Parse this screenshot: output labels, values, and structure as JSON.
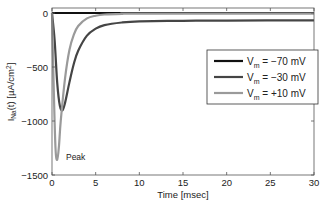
{
  "chart_data": {
    "type": "line",
    "title": "",
    "xlabel": "Time [msec]",
    "ylabel": "I_Na(t) [µA/cm²]",
    "ylabel_parts": {
      "main": "I",
      "sub": "Na",
      "rest": "(t) [µA/cm",
      "sup": "2",
      "end": "]"
    },
    "xlim": [
      0,
      30
    ],
    "ylim": [
      -1500,
      50
    ],
    "xticks": [
      0,
      5,
      10,
      15,
      20,
      25,
      30
    ],
    "yticks": [
      0,
      -500,
      -1000,
      -1500
    ],
    "xtick_labels": [
      "0",
      "5",
      "10",
      "15",
      "20",
      "25",
      "30"
    ],
    "ytick_labels": [
      "0",
      "−500",
      "−1000",
      "−1500"
    ],
    "grid": false,
    "legend_position": "right-center",
    "annotations": [
      {
        "text": "Peak",
        "x": 1.6,
        "y": -1330
      }
    ],
    "series": [
      {
        "name": "Vm = −70 mV",
        "legend": {
          "main": "V",
          "sub": "m",
          "rest": " = −70 mV"
        },
        "color": "#111111",
        "x": [
          0,
          30
        ],
        "values": [
          0,
          0
        ]
      },
      {
        "name": "Vm = −30 mV",
        "legend": {
          "main": "V",
          "sub": "m",
          "rest": " = −30 mV"
        },
        "color": "#454545",
        "x": [
          0,
          0.3,
          0.6,
          0.9,
          1.2,
          1.5,
          2,
          2.5,
          3,
          4,
          5,
          6,
          8,
          10,
          15,
          20,
          30
        ],
        "values": [
          0,
          -250,
          -650,
          -860,
          -900,
          -830,
          -640,
          -470,
          -350,
          -210,
          -145,
          -112,
          -88,
          -78,
          -72,
          -70,
          -68
        ]
      },
      {
        "name": "Vm = +10 mV",
        "legend": {
          "main": "V",
          "sub": "m",
          "rest": " = +10 mV"
        },
        "color": "#9a9a9a",
        "x": [
          0,
          0.2,
          0.4,
          0.6,
          0.8,
          1,
          1.5,
          2,
          2.5,
          3,
          4,
          5,
          6,
          8,
          10,
          30
        ],
        "values": [
          0,
          -700,
          -1250,
          -1360,
          -1230,
          -1000,
          -600,
          -340,
          -200,
          -120,
          -50,
          -25,
          -14,
          -8,
          -6,
          -5
        ]
      }
    ]
  }
}
